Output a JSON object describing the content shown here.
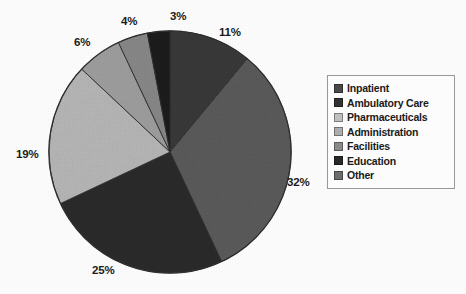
{
  "chart_data": {
    "type": "pie",
    "title": "",
    "categories": [
      "Inpatient",
      "Ambulatory Care",
      "Pharmaceuticals",
      "Administration",
      "Facilities",
      "Education",
      "Other"
    ],
    "values": [
      11,
      32,
      25,
      19,
      6,
      4,
      3
    ],
    "value_labels": [
      "11%",
      "32%",
      "25%",
      "19%",
      "6%",
      "4%",
      "3%"
    ],
    "units": "percent",
    "total": 100,
    "start_angle_deg": 0,
    "direction": "clockwise",
    "legend_position": "right",
    "grid": false,
    "colors": [
      "#3a3a3a",
      "#5c5c5c",
      "#2b2b2b",
      "#b9b9b9",
      "#a0a0a0",
      "#8a8a8a",
      "#1e1e1e"
    ]
  },
  "pie": {
    "slices": [
      {
        "label": "Inpatient",
        "pct_text": "11%",
        "value": 11,
        "color": "#3a3a3a",
        "label_x": 219,
        "label_y": 26
      },
      {
        "label": "Ambulatory Care",
        "pct_text": "32%",
        "value": 32,
        "color": "#5c5c5c",
        "label_x": 287,
        "label_y": 176
      },
      {
        "label": "Pharmaceuticals",
        "pct_text": "25%",
        "value": 25,
        "color": "#2b2b2b",
        "label_x": 92,
        "label_y": 264
      },
      {
        "label": "Administration",
        "pct_text": "19%",
        "value": 19,
        "color": "#b9b9b9",
        "label_x": 16,
        "label_y": 148
      },
      {
        "label": "Facilities",
        "pct_text": "6%",
        "value": 6,
        "color": "#a0a0a0",
        "label_x": 74,
        "label_y": 36
      },
      {
        "label": "Education",
        "pct_text": "4%",
        "value": 4,
        "color": "#8a8a8a",
        "label_x": 121,
        "label_y": 15
      },
      {
        "label": "Other",
        "pct_text": "3%",
        "value": 3,
        "color": "#1e1e1e",
        "label_x": 170,
        "label_y": 10
      }
    ]
  },
  "legend": {
    "items": [
      {
        "label": "Inpatient",
        "color": "#4a4a4a"
      },
      {
        "label": "Ambulatory Care",
        "color": "#333333"
      },
      {
        "label": "Pharmaceuticals",
        "color": "#c2c2c2"
      },
      {
        "label": "Administration",
        "color": "#b0b0b0"
      },
      {
        "label": "Facilities",
        "color": "#8d8d8d"
      },
      {
        "label": "Education",
        "color": "#2a2a2a"
      },
      {
        "label": "Other",
        "color": "#6e6e6e"
      }
    ]
  }
}
